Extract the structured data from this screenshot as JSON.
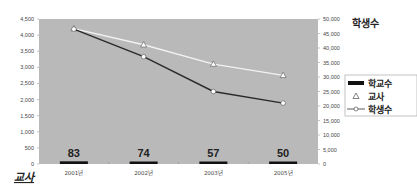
{
  "chart_data": {
    "type": "bar+line",
    "title": "",
    "categories": [
      "2001년",
      "2002년",
      "2003년",
      "2005년"
    ],
    "left_axis": {
      "title": "교사",
      "ylim": [
        0,
        4500
      ],
      "ticks": [
        "0",
        "500",
        "1,000",
        "1,500",
        "2,000",
        "2,500",
        "3,000",
        "3,500",
        "4,000",
        "4,500"
      ]
    },
    "right_axis": {
      "title": "학생수",
      "ylim": [
        0,
        50000
      ],
      "ticks": [
        "0",
        "5,000",
        "10,000",
        "15,000",
        "20,000",
        "25,000",
        "30,000",
        "35,000",
        "40,000",
        "45,000",
        "50,000"
      ]
    },
    "series": [
      {
        "name": "학교수",
        "type": "bar",
        "axis": "left",
        "color": "#111111",
        "values": [
          83,
          74,
          57,
          50
        ],
        "labels": [
          "83",
          "74",
          "57",
          "50"
        ]
      },
      {
        "name": "교사",
        "type": "line",
        "marker": "triangle",
        "axis": "left",
        "color": "#f2f2f2",
        "values": [
          4200,
          3700,
          3100,
          2750
        ]
      },
      {
        "name": "학생수",
        "type": "line",
        "marker": "circle",
        "axis": "right",
        "color": "#2a2a2a",
        "values": [
          46500,
          37000,
          25000,
          21000
        ]
      }
    ],
    "legend": {
      "position": "right",
      "entries": [
        "학교수",
        "교사",
        "학생수"
      ]
    },
    "grid": false,
    "plot_background": "#b9b9b9"
  }
}
